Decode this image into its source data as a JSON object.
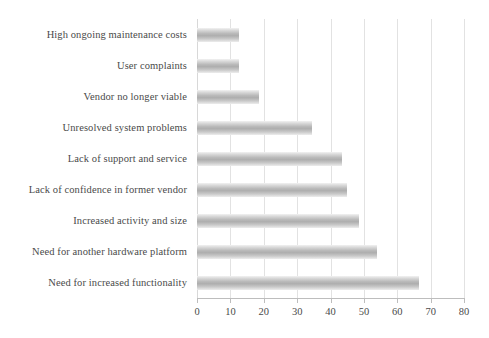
{
  "chart_data": {
    "type": "bar",
    "orientation": "horizontal",
    "title": "",
    "subtitle": "",
    "xlabel": "",
    "ylabel": "",
    "xlim": [
      0,
      80
    ],
    "xticks": [
      0,
      10,
      20,
      30,
      40,
      50,
      60,
      70,
      80
    ],
    "xtick_labels": [
      "0",
      "10",
      "20",
      "30",
      "40",
      "50",
      "60",
      "70",
      "80"
    ],
    "grid": "vertical",
    "legend": "none",
    "bar_color": "#b0b0b0",
    "gridline_color": "#e2e2e2",
    "axis_color": "#bdbdbd",
    "text_color": "#4a4a4a",
    "categories": [
      "High ongoing maintenance costs",
      "User complaints",
      "Vendor no longer viable",
      "Unresolved system problems",
      "Lack of support and service",
      "Lack of confidence in former vendor",
      "Increased activity and size",
      "Need for another hardware platform",
      "Need for increased functionality"
    ],
    "values": [
      12.5,
      12.5,
      18.5,
      34.5,
      43.5,
      45,
      48.5,
      54,
      66.5
    ]
  }
}
